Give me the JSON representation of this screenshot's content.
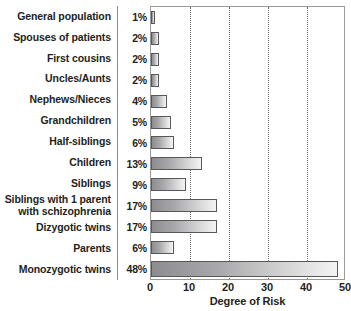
{
  "chart_data": {
    "type": "bar",
    "orientation": "horizontal",
    "title": "",
    "xlabel": "Degree of Risk",
    "ylabel": "",
    "xlim": [
      0,
      50
    ],
    "xticks": [
      0,
      10,
      20,
      30,
      40,
      50
    ],
    "grid": "vertical dotted gridlines at 10, 20, 30, 40",
    "legend": "none",
    "categories": [
      "General population",
      "Spouses of patients",
      "First cousins",
      "Uncles/Aunts",
      "Nephews/Nieces",
      "Grandchildren",
      "Half-siblings",
      "Children",
      "Siblings",
      "Siblings with 1 parent\nwith schizophrenia",
      "Dizygotic twins",
      "Parents",
      "Monozygotic twins"
    ],
    "values": [
      1,
      2,
      2,
      2,
      4,
      5,
      6,
      13,
      9,
      17,
      17,
      6,
      48
    ],
    "value_labels": [
      "1%",
      "2%",
      "2%",
      "2%",
      "4%",
      "5%",
      "6%",
      "13%",
      "9%",
      "17%",
      "17%",
      "6%",
      "48%"
    ]
  },
  "colors": {
    "text": "#231f20",
    "bar_border": "#58585a",
    "bar_fill_start": "#8d8d8f",
    "bar_fill_end": "#f4f4f4",
    "plot_border": "#9a9a9a",
    "gridline": "#6e6e6e",
    "divider": "#8c8c8c"
  }
}
